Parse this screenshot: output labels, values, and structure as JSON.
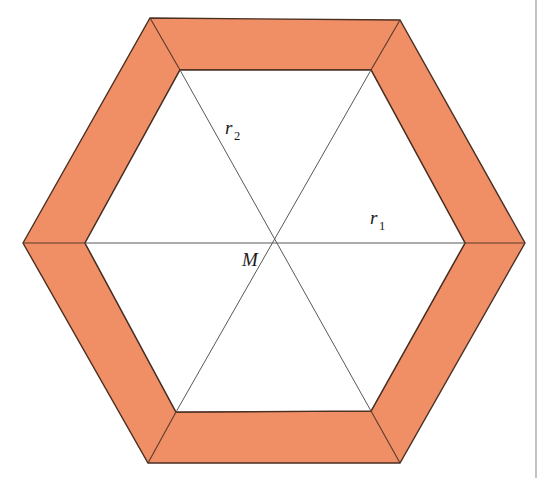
{
  "figure": {
    "background_color": "#ffffff",
    "band": {
      "name": "hexagonal-band",
      "fill_color": "#F08F66",
      "outline_color": "#4a2f23",
      "outline_width": 1.4,
      "mitre_line_color": "#5a3a2a",
      "mitre_line_width": 1.1,
      "outer_vertices": [
        [
          23,
          243
        ],
        [
          150,
          18
        ],
        [
          400,
          20
        ],
        [
          525,
          243
        ],
        [
          400,
          463
        ],
        [
          148,
          463
        ]
      ],
      "inner_vertices": [
        [
          85,
          243
        ],
        [
          180,
          70
        ],
        [
          371,
          70
        ],
        [
          465,
          243
        ],
        [
          371,
          411
        ],
        [
          176,
          412
        ]
      ]
    },
    "interior": {
      "name": "inner-hexagon-interior",
      "fill_color": "#ffffff"
    },
    "diagonals": {
      "name": "center-diagonals",
      "stroke_color": "#58585a",
      "stroke_width": 1.0,
      "segments": [
        {
          "name": "diagonal-horizontal",
          "from": [
            85,
            243
          ],
          "to": [
            465,
            243
          ]
        },
        {
          "name": "diagonal-top-left-to-bottom-right",
          "from": [
            180,
            70
          ],
          "to": [
            371,
            411
          ]
        },
        {
          "name": "diagonal-top-right-to-bottom-left",
          "from": [
            371,
            70
          ],
          "to": [
            176,
            412
          ]
        }
      ]
    },
    "center_point": {
      "name": "center-M",
      "x": 274,
      "y": 243
    },
    "labels": [
      {
        "id": "label-r1",
        "base": "r",
        "subscript": "1",
        "x": 370,
        "y": 224,
        "meaning": "radius of circumscribed circle of inner hexagon"
      },
      {
        "id": "label-r2",
        "base": "r",
        "subscript": "2",
        "x": 225,
        "y": 134,
        "meaning": "second radius marker along diagonal"
      },
      {
        "id": "label-M",
        "base": "M",
        "subscript": "",
        "x": 242,
        "y": 266,
        "meaning": "center point of the hexagon"
      }
    ],
    "page_rule": {
      "name": "page-column-rule",
      "x": 536,
      "color": "#9a9a9a",
      "width": 1.2
    }
  }
}
